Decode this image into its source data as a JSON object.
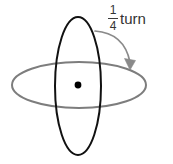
{
  "figure": {
    "background_color": "#ffffff",
    "width": 173,
    "height": 164,
    "annotation": {
      "fraction": {
        "numerator": "1",
        "denominator": "4"
      },
      "word": "turn",
      "full_text": "1/4 turn",
      "text_color": "#333333"
    },
    "shapes": {
      "vertical_ellipse": {
        "name": "vertical-ellipse",
        "stroke_color": "#111111",
        "stroke_width": 2,
        "fill": "none",
        "center_x": 78,
        "center_y": 86,
        "radius_x": 23,
        "radius_y": 69
      },
      "horizontal_ellipse": {
        "name": "horizontal-ellipse",
        "stroke_color": "#7d7d7d",
        "stroke_width": 2,
        "fill": "none",
        "center_x": 79,
        "center_y": 85,
        "radius_x": 67,
        "radius_y": 23
      },
      "center_dot": {
        "name": "center-dot",
        "fill_color": "#000000",
        "center_x": 78,
        "center_y": 85,
        "radius": 3.4
      },
      "rotation_arrow": {
        "name": "rotation-arrow",
        "stroke_color": "#8a8a8a",
        "stroke_width": 1.6,
        "start_x": 95,
        "start_y": 31,
        "control_x": 127,
        "control_y": 35,
        "end_x": 131,
        "end_y": 66,
        "arrowhead_fill": "#8a8a8a",
        "direction": "clockwise-down-right"
      }
    }
  }
}
